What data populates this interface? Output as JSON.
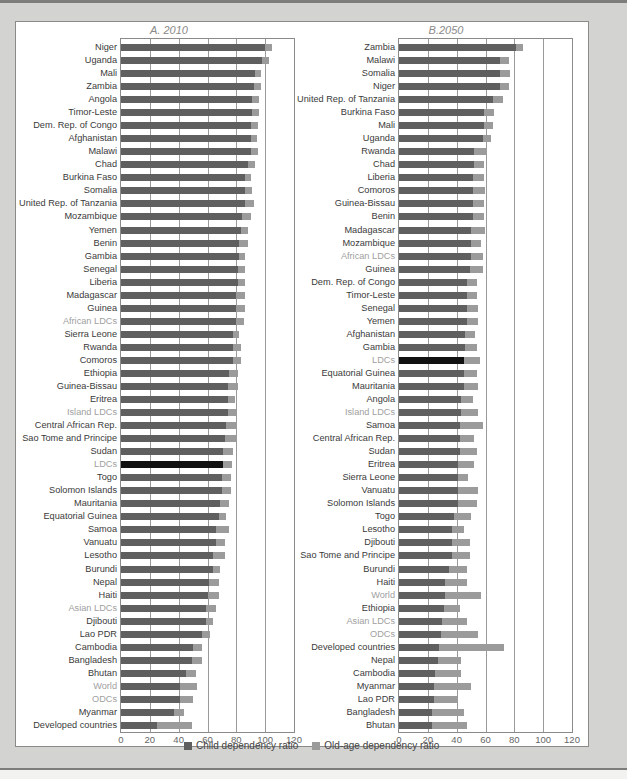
{
  "colors": {
    "child": "#5f5f5f",
    "old_age": "#9b9b9b",
    "ldc_highlight": "#111111",
    "aggregate_label": "#a0a0a0"
  },
  "legend": {
    "child_label": "Child dependency ratio",
    "old_label": "Old-age dependency ratio"
  },
  "axis": {
    "ticks": [
      "0",
      "20",
      "40",
      "60",
      "80",
      "100",
      "120"
    ]
  },
  "chart_data": [
    {
      "type": "bar",
      "orientation": "horizontal",
      "stacked": true,
      "title": "A. 2010",
      "xlim": [
        0,
        120
      ],
      "grid": true,
      "legend_position": "bottom",
      "series_names": [
        "Child dependency ratio",
        "Old-age dependency ratio"
      ],
      "rows": [
        {
          "name": "Niger",
          "child": 100,
          "old": 5,
          "agg": false
        },
        {
          "name": "Uganda",
          "child": 98,
          "old": 5,
          "agg": false
        },
        {
          "name": "Mali",
          "child": 93,
          "old": 4,
          "agg": false
        },
        {
          "name": "Zambia",
          "child": 92,
          "old": 5,
          "agg": false
        },
        {
          "name": "Angola",
          "child": 91,
          "old": 5,
          "agg": false
        },
        {
          "name": "Timor-Leste",
          "child": 91,
          "old": 5,
          "agg": false
        },
        {
          "name": "Dem. Rep. of Congo",
          "child": 90,
          "old": 5,
          "agg": false
        },
        {
          "name": "Afghanistan",
          "child": 90,
          "old": 4,
          "agg": false
        },
        {
          "name": "Malawi",
          "child": 90,
          "old": 5,
          "agg": false
        },
        {
          "name": "Chad",
          "child": 88,
          "old": 5,
          "agg": false
        },
        {
          "name": "Burkina Faso",
          "child": 86,
          "old": 4,
          "agg": false
        },
        {
          "name": "Somalia",
          "child": 86,
          "old": 5,
          "agg": false
        },
        {
          "name": "United Rep. of Tanzania",
          "child": 86,
          "old": 6,
          "agg": false
        },
        {
          "name": "Mozambique",
          "child": 84,
          "old": 6,
          "agg": false
        },
        {
          "name": "Yemen",
          "child": 83,
          "old": 5,
          "agg": false
        },
        {
          "name": "Benin",
          "child": 82,
          "old": 6,
          "agg": false
        },
        {
          "name": "Gambia",
          "child": 82,
          "old": 4,
          "agg": false
        },
        {
          "name": "Senegal",
          "child": 81,
          "old": 5,
          "agg": false
        },
        {
          "name": "Liberia",
          "child": 81,
          "old": 5,
          "agg": false
        },
        {
          "name": "Madagascar",
          "child": 80,
          "old": 6,
          "agg": false
        },
        {
          "name": "Guinea",
          "child": 80,
          "old": 6,
          "agg": false
        },
        {
          "name": "African LDCs",
          "child": 80,
          "old": 5,
          "agg": true
        },
        {
          "name": "Sierra Leone",
          "child": 78,
          "old": 4,
          "agg": false
        },
        {
          "name": "Rwanda",
          "child": 78,
          "old": 5,
          "agg": false
        },
        {
          "name": "Comoros",
          "child": 78,
          "old": 5,
          "agg": false
        },
        {
          "name": "Ethiopia",
          "child": 75,
          "old": 6,
          "agg": false
        },
        {
          "name": "Guinea-Bissau",
          "child": 74,
          "old": 7,
          "agg": false
        },
        {
          "name": "Eritrea",
          "child": 74,
          "old": 5,
          "agg": false
        },
        {
          "name": "Island LDCs",
          "child": 74,
          "old": 6,
          "agg": true
        },
        {
          "name": "Central African Rep.",
          "child": 73,
          "old": 7,
          "agg": false
        },
        {
          "name": "Sao Tome and Principe",
          "child": 72,
          "old": 8,
          "agg": false
        },
        {
          "name": "Sudan",
          "child": 71,
          "old": 7,
          "agg": false
        },
        {
          "name": "LDCs",
          "child": 71,
          "old": 6,
          "agg": true,
          "highlight": true
        },
        {
          "name": "Togo",
          "child": 70,
          "old": 6,
          "agg": false
        },
        {
          "name": "Solomon Islands",
          "child": 70,
          "old": 6,
          "agg": false
        },
        {
          "name": "Mauritania",
          "child": 69,
          "old": 6,
          "agg": false
        },
        {
          "name": "Equatorial Guinea",
          "child": 68,
          "old": 5,
          "agg": false
        },
        {
          "name": "Samoa",
          "child": 66,
          "old": 9,
          "agg": false
        },
        {
          "name": "Vanuatu",
          "child": 66,
          "old": 6,
          "agg": false
        },
        {
          "name": "Lesotho",
          "child": 64,
          "old": 8,
          "agg": false
        },
        {
          "name": "Burundi",
          "child": 64,
          "old": 5,
          "agg": false
        },
        {
          "name": "Nepal",
          "child": 61,
          "old": 7,
          "agg": false
        },
        {
          "name": "Haiti",
          "child": 60,
          "old": 8,
          "agg": false
        },
        {
          "name": "Asian LDCs",
          "child": 59,
          "old": 7,
          "agg": true
        },
        {
          "name": "Djibouti",
          "child": 59,
          "old": 5,
          "agg": false
        },
        {
          "name": "Lao PDR",
          "child": 56,
          "old": 6,
          "agg": false
        },
        {
          "name": "Cambodia",
          "child": 50,
          "old": 6,
          "agg": false
        },
        {
          "name": "Bangladesh",
          "child": 49,
          "old": 7,
          "agg": false
        },
        {
          "name": "Bhutan",
          "child": 45,
          "old": 7,
          "agg": false
        },
        {
          "name": "World",
          "child": 41,
          "old": 12,
          "agg": true
        },
        {
          "name": "ODCs",
          "child": 41,
          "old": 9,
          "agg": true
        },
        {
          "name": "Myanmar",
          "child": 37,
          "old": 7,
          "agg": false
        },
        {
          "name": "Developed countries",
          "child": 25,
          "old": 24,
          "agg": false
        }
      ]
    },
    {
      "type": "bar",
      "orientation": "horizontal",
      "stacked": true,
      "title": "B.2050",
      "xlim": [
        0,
        120
      ],
      "grid": true,
      "legend_position": "bottom",
      "series_names": [
        "Child dependency ratio",
        "Old-age dependency ratio"
      ],
      "rows": [
        {
          "name": "Zambia",
          "child": 81,
          "old": 5,
          "agg": false
        },
        {
          "name": "Malawi",
          "child": 70,
          "old": 6,
          "agg": false
        },
        {
          "name": "Somalia",
          "child": 70,
          "old": 7,
          "agg": false
        },
        {
          "name": "Niger",
          "child": 70,
          "old": 6,
          "agg": false
        },
        {
          "name": "United Rep. of Tanzania",
          "child": 65,
          "old": 7,
          "agg": false
        },
        {
          "name": "Burkina Faso",
          "child": 59,
          "old": 7,
          "agg": false
        },
        {
          "name": "Mali",
          "child": 59,
          "old": 6,
          "agg": false
        },
        {
          "name": "Uganda",
          "child": 58,
          "old": 6,
          "agg": false
        },
        {
          "name": "Rwanda",
          "child": 52,
          "old": 9,
          "agg": false
        },
        {
          "name": "Chad",
          "child": 52,
          "old": 7,
          "agg": false
        },
        {
          "name": "Liberia",
          "child": 51,
          "old": 8,
          "agg": false
        },
        {
          "name": "Comoros",
          "child": 51,
          "old": 9,
          "agg": false
        },
        {
          "name": "Guinea-Bissau",
          "child": 51,
          "old": 8,
          "agg": false
        },
        {
          "name": "Benin",
          "child": 51,
          "old": 8,
          "agg": false
        },
        {
          "name": "Madagascar",
          "child": 50,
          "old": 10,
          "agg": false
        },
        {
          "name": "Mozambique",
          "child": 50,
          "old": 7,
          "agg": false
        },
        {
          "name": "African LDCs",
          "child": 50,
          "old": 8,
          "agg": true
        },
        {
          "name": "Guinea",
          "child": 49,
          "old": 9,
          "agg": false
        },
        {
          "name": "Dem. Rep. of Congo",
          "child": 47,
          "old": 7,
          "agg": false
        },
        {
          "name": "Timor-Leste",
          "child": 47,
          "old": 7,
          "agg": false
        },
        {
          "name": "Senegal",
          "child": 47,
          "old": 8,
          "agg": false
        },
        {
          "name": "Yemen",
          "child": 47,
          "old": 8,
          "agg": false
        },
        {
          "name": "Afghanistan",
          "child": 46,
          "old": 7,
          "agg": false
        },
        {
          "name": "Gambia",
          "child": 46,
          "old": 8,
          "agg": false
        },
        {
          "name": "LDCs",
          "child": 45,
          "old": 11,
          "agg": true,
          "highlight": true
        },
        {
          "name": "Equatorial Guinea",
          "child": 45,
          "old": 9,
          "agg": false
        },
        {
          "name": "Mauritania",
          "child": 45,
          "old": 10,
          "agg": false
        },
        {
          "name": "Angola",
          "child": 43,
          "old": 8,
          "agg": false
        },
        {
          "name": "Island LDCs",
          "child": 43,
          "old": 12,
          "agg": true
        },
        {
          "name": "Samoa",
          "child": 42,
          "old": 16,
          "agg": false
        },
        {
          "name": "Central African Rep.",
          "child": 42,
          "old": 10,
          "agg": false
        },
        {
          "name": "Sudan",
          "child": 42,
          "old": 12,
          "agg": false
        },
        {
          "name": "Eritrea",
          "child": 41,
          "old": 11,
          "agg": false
        },
        {
          "name": "Sierra Leone",
          "child": 41,
          "old": 7,
          "agg": false
        },
        {
          "name": "Vanuatu",
          "child": 41,
          "old": 14,
          "agg": false
        },
        {
          "name": "Solomon Islands",
          "child": 41,
          "old": 13,
          "agg": false
        },
        {
          "name": "Togo",
          "child": 38,
          "old": 12,
          "agg": false
        },
        {
          "name": "Lesotho",
          "child": 37,
          "old": 8,
          "agg": false
        },
        {
          "name": "Djibouti",
          "child": 37,
          "old": 12,
          "agg": false
        },
        {
          "name": "Sao Tome and Principe",
          "child": 37,
          "old": 12,
          "agg": false
        },
        {
          "name": "Burundi",
          "child": 35,
          "old": 12,
          "agg": false
        },
        {
          "name": "Haiti",
          "child": 32,
          "old": 15,
          "agg": false
        },
        {
          "name": "World",
          "child": 32,
          "old": 25,
          "agg": true
        },
        {
          "name": "Ethiopia",
          "child": 31,
          "old": 11,
          "agg": false
        },
        {
          "name": "Asian LDCs",
          "child": 30,
          "old": 17,
          "agg": true
        },
        {
          "name": "ODCs",
          "child": 29,
          "old": 26,
          "agg": true
        },
        {
          "name": "Developed countries",
          "child": 28,
          "old": 45,
          "agg": false
        },
        {
          "name": "Nepal",
          "child": 27,
          "old": 16,
          "agg": false
        },
        {
          "name": "Cambodia",
          "child": 25,
          "old": 18,
          "agg": false
        },
        {
          "name": "Myanmar",
          "child": 24,
          "old": 26,
          "agg": false
        },
        {
          "name": "Lao PDR",
          "child": 24,
          "old": 17,
          "agg": false
        },
        {
          "name": "Bangladesh",
          "child": 23,
          "old": 22,
          "agg": false
        },
        {
          "name": "Bhutan",
          "child": 23,
          "old": 24,
          "agg": false
        }
      ]
    }
  ]
}
